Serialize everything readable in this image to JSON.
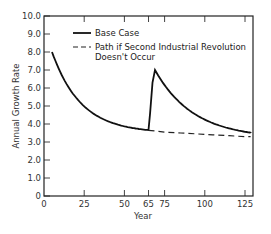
{
  "chart_data": {
    "type": "line",
    "title": "",
    "xlabel": "Year",
    "ylabel": "Annual Growth Rate",
    "xlim": [
      0,
      130
    ],
    "ylim": [
      0,
      10
    ],
    "x_ticks": [
      "0",
      "25",
      "50",
      "65",
      "75",
      "100",
      "125"
    ],
    "y_ticks": [
      "0",
      "1.0",
      "2.0",
      "3.0",
      "4.0",
      "5.0",
      "6.0",
      "7.0",
      "8.0",
      "9.0",
      "10.0"
    ],
    "grid": false,
    "legend_position": "upper right (inside)",
    "series": [
      {
        "name": "Base Case",
        "style": "solid",
        "x": [
          5,
          15,
          25,
          35,
          45,
          55,
          65,
          66,
          68,
          69,
          75,
          85,
          95,
          105,
          115,
          125,
          130
        ],
        "y": [
          8.0,
          6.5,
          5.4,
          4.6,
          4.1,
          3.8,
          3.7,
          4.5,
          6.5,
          7.0,
          6.2,
          5.1,
          4.3,
          3.8,
          3.45,
          3.3,
          3.3
        ]
      },
      {
        "name": "Path if Second Industrial Revolution Doesn't Occur",
        "style": "dashed",
        "x": [
          65,
          75,
          85,
          95,
          105,
          115,
          125,
          130
        ],
        "y": [
          3.65,
          3.55,
          3.5,
          3.45,
          3.4,
          3.35,
          3.3,
          3.3
        ]
      }
    ]
  },
  "legend": {
    "base": "Base Case",
    "alt_line1": "Path if Second Industrial Revolution",
    "alt_line2": "Doesn't Occur"
  },
  "axes": {
    "xlabel": "Year",
    "ylabel": "Annual Growth Rate"
  }
}
